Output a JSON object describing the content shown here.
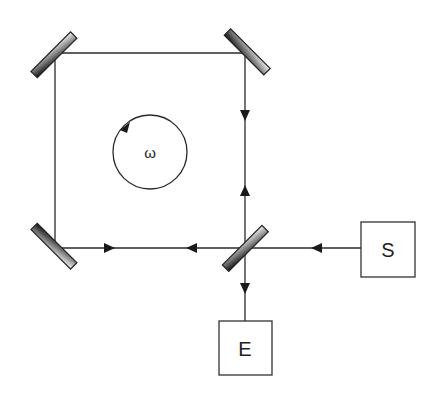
{
  "diagram": {
    "rotation_label": "ω",
    "source_label": "S",
    "detector_label": "E",
    "colors": {
      "line": "#2a2a2a",
      "mirror_dark": "#1a1a1a",
      "mirror_light": "#f2f2f2",
      "box_stroke": "#333333"
    },
    "components": [
      {
        "id": "mirror-top-left",
        "type": "mirror"
      },
      {
        "id": "mirror-top-right",
        "type": "mirror"
      },
      {
        "id": "mirror-bottom-left",
        "type": "mirror"
      },
      {
        "id": "beam-splitter",
        "type": "beam-splitter"
      },
      {
        "id": "source",
        "type": "box",
        "label": "S"
      },
      {
        "id": "detector",
        "type": "box",
        "label": "E"
      }
    ]
  }
}
